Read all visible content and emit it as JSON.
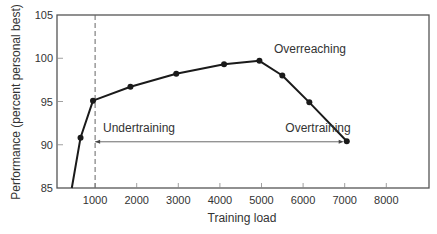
{
  "chart_data": {
    "type": "line",
    "title": "",
    "xlabel": "Training load",
    "ylabel": "Performance (percent personal best)",
    "xlim": [
      0,
      9000
    ],
    "ylim": [
      85,
      105
    ],
    "x_ticks": [
      1000,
      2000,
      3000,
      4000,
      5000,
      6000,
      7000,
      8000
    ],
    "x_tick_labels": [
      "1000",
      "2000",
      "3000",
      "4000",
      "5000",
      "6000",
      "7000",
      "8000"
    ],
    "y_ticks": [
      85,
      90,
      95,
      100,
      105
    ],
    "y_tick_labels": [
      "85",
      "90",
      "95",
      "100",
      "105"
    ],
    "grid": false,
    "series": [
      {
        "name": "Performance",
        "x": [
          440,
          650,
          950,
          1850,
          2950,
          4100,
          4950,
          5500,
          6150,
          7050
        ],
        "y": [
          85.0,
          90.8,
          95.1,
          96.7,
          98.2,
          99.3,
          99.7,
          98.0,
          94.9,
          90.4
        ],
        "markers": [
          false,
          true,
          true,
          true,
          true,
          true,
          true,
          true,
          true,
          true
        ]
      }
    ],
    "reference_line": {
      "type": "vertical",
      "x": 1000,
      "style": "dashed"
    },
    "annotations": [
      {
        "text": "Undertraining",
        "x": 1250,
        "y": 91.5
      },
      {
        "text": "Overtraining",
        "x": 5800,
        "y": 91.5
      },
      {
        "text": "Overreaching",
        "x": 5600,
        "y": 101.5
      }
    ],
    "arrow": {
      "from_x": 1000,
      "to_x": 7000,
      "y": 90.4,
      "label_left": "Undertraining",
      "label_right": "Overtraining"
    },
    "colors": {
      "line": "#1a1a1a",
      "axis": "#555555",
      "text": "#333333"
    }
  }
}
